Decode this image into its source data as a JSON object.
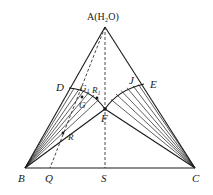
{
  "diagram": {
    "type": "ternary-phase-diagram",
    "vertices": {
      "A": {
        "label": "A(H₂O)",
        "x": 105,
        "y": 27
      },
      "B": {
        "label": "B",
        "x": 25,
        "y": 168
      },
      "C": {
        "label": "C",
        "x": 195,
        "y": 168
      }
    },
    "points": {
      "D": {
        "label": "D",
        "x": 69,
        "y": 88
      },
      "E": {
        "label": "E",
        "x": 144,
        "y": 84
      },
      "F": {
        "label": "F",
        "x": 105,
        "y": 109
      },
      "J": {
        "label": "J"
      },
      "G1": {
        "label": "G",
        "sub": "1"
      },
      "R1": {
        "label": "R",
        "sub": "1"
      },
      "G": {
        "label": "G"
      },
      "R": {
        "label": "R"
      },
      "Q": {
        "label": "Q",
        "x": 50,
        "y": 168
      },
      "S": {
        "label": "S",
        "x": 105,
        "y": 168
      }
    }
  }
}
